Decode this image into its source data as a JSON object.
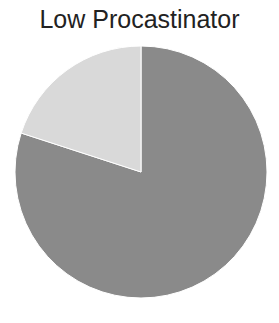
{
  "chart_data": {
    "type": "pie",
    "title": "Low Procastinator",
    "slices": [
      {
        "label": "",
        "value": 80,
        "color": "#8a8a8a"
      },
      {
        "label": "",
        "value": 20,
        "color": "#d9d9d9"
      }
    ],
    "start_angle_deg": 0,
    "direction": "clockwise",
    "legend": "none"
  }
}
